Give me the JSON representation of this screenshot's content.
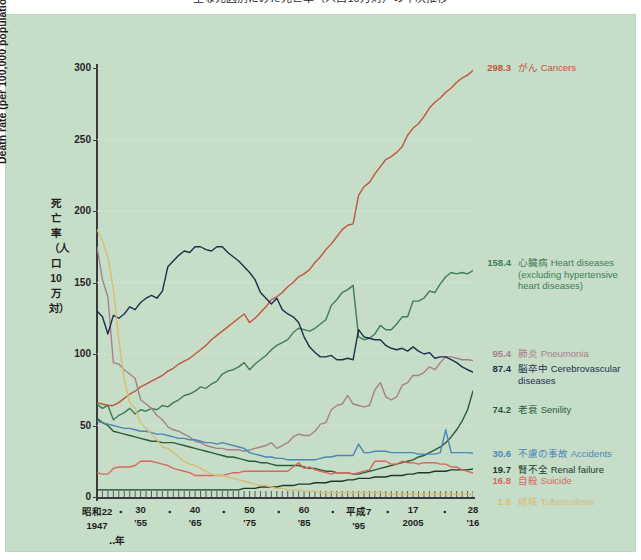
{
  "title": "主な死因別にみた死亡率（人口10万対）の年次推移",
  "axes": {
    "y_label_en": "Death rate (per 100,000 population)",
    "y_label_jp": "死亡率（人口10万対）",
    "y_ticks": [
      "0",
      "50",
      "100",
      "150",
      "200",
      "250",
      "300"
    ],
    "x_year_note": "‥年",
    "x_ticks": [
      {
        "jp": "昭和22",
        "en": "1947"
      },
      {
        "jp": "30",
        "en": "'55"
      },
      {
        "jp": "40",
        "en": "'65"
      },
      {
        "jp": "50",
        "en": "'75"
      },
      {
        "jp": "60",
        "en": "'85"
      },
      {
        "jp": "平成7",
        "en": "'95"
      },
      {
        "jp": "17",
        "en": "2005"
      },
      {
        "jp": "28",
        "en": "'16"
      }
    ],
    "x_separator": "・"
  },
  "legend": [
    {
      "value": "298.3",
      "jp": "がん",
      "en": "Cancers",
      "sub": "",
      "color": "#c0563a"
    },
    {
      "value": "158.4",
      "jp": "心臓病",
      "en": "Heart diseases",
      "sub": "(excluding hypertensive\nheart diseases)",
      "color": "#3f7d55"
    },
    {
      "value": "95.4",
      "jp": "肺炎",
      "en": "Pneumonia",
      "sub": "",
      "color": "#a8808c"
    },
    {
      "value": "87.4",
      "jp": "脳卒中",
      "en": "Cerebrovascular\ndiseases",
      "sub": "",
      "color": "#1d2f4e"
    },
    {
      "value": "74.2",
      "jp": "老衰",
      "en": "Senility",
      "sub": "",
      "color": "#2b5c38"
    },
    {
      "value": "30.6",
      "jp": "不慮の事故",
      "en": "Accidents",
      "sub": "",
      "color": "#4a86b8"
    },
    {
      "value": "19.7",
      "jp": "腎不全",
      "en": "Renal failure",
      "sub": "",
      "color": "#1b3a2a"
    },
    {
      "value": "16.8",
      "jp": "自殺",
      "en": "Suicide",
      "sub": "",
      "color": "#d9675e"
    },
    {
      "value": "1.5",
      "jp": "結核",
      "en": "Tuberculosis",
      "sub": "",
      "color": "#d9bc72"
    }
  ],
  "chart_data": {
    "type": "line",
    "title": "主な死因別にみた死亡率（人口10万対）の年次推移",
    "xlabel": "Year",
    "ylabel": "Death rate (per 100,000 population)",
    "xlim": [
      1947,
      2016
    ],
    "ylim": [
      0,
      300
    ],
    "grid": true,
    "legend_position": "right-inline-endpoints",
    "x": [
      1947,
      1948,
      1949,
      1950,
      1951,
      1952,
      1953,
      1954,
      1955,
      1956,
      1957,
      1958,
      1959,
      1960,
      1961,
      1962,
      1963,
      1964,
      1965,
      1966,
      1967,
      1968,
      1969,
      1970,
      1971,
      1972,
      1973,
      1974,
      1975,
      1976,
      1977,
      1978,
      1979,
      1980,
      1981,
      1982,
      1983,
      1984,
      1985,
      1986,
      1987,
      1988,
      1989,
      1990,
      1991,
      1992,
      1993,
      1994,
      1995,
      1996,
      1997,
      1998,
      1999,
      2000,
      2001,
      2002,
      2003,
      2004,
      2005,
      2006,
      2007,
      2008,
      2009,
      2010,
      2011,
      2012,
      2013,
      2014,
      2015,
      2016
    ],
    "series": [
      {
        "name": "がん Cancers",
        "color": "#c0563a",
        "end_value": 298.3,
        "values": [
          66,
          65,
          64,
          64,
          66,
          69,
          72,
          74,
          77,
          79,
          81,
          83,
          85,
          88,
          90,
          93,
          95,
          97,
          100,
          103,
          106,
          110,
          113,
          116,
          119,
          122,
          125,
          128,
          122,
          125,
          129,
          133,
          138,
          140,
          143,
          147,
          150,
          154,
          156,
          159,
          164,
          168,
          173,
          177,
          182,
          187,
          190,
          191,
          211,
          217,
          220,
          226,
          231,
          236,
          238,
          241,
          245,
          253,
          258,
          261,
          266,
          272,
          276,
          279,
          283,
          286,
          290,
          293,
          295,
          298.3
        ]
      },
      {
        "name": "心臓病 Heart diseases",
        "color": "#3f7d55",
        "end_value": 158.4,
        "values": [
          65,
          62,
          64,
          54,
          57,
          59,
          62,
          58,
          61,
          60,
          62,
          61,
          64,
          63,
          66,
          68,
          71,
          72,
          74,
          77,
          76,
          79,
          81,
          86,
          88,
          89,
          91,
          94,
          89,
          93,
          96,
          99,
          103,
          106,
          108,
          110,
          115,
          118,
          117,
          116,
          118,
          121,
          124,
          134,
          138,
          143,
          145,
          148,
          112,
          110,
          111,
          114,
          120,
          117,
          117,
          121,
          126,
          126,
          137,
          137,
          139,
          144,
          143,
          149,
          154,
          157,
          156,
          157,
          156,
          158.4
        ]
      },
      {
        "name": "肺炎 Pneumonia",
        "color": "#a8808c",
        "end_value": 95.4,
        "values": [
          175,
          152,
          140,
          94,
          93,
          89,
          86,
          83,
          68,
          65,
          62,
          57,
          54,
          49,
          47,
          46,
          44,
          42,
          39,
          38,
          36,
          35,
          34,
          34,
          33,
          33,
          33,
          32,
          33,
          34,
          35,
          36,
          38,
          34,
          36,
          38,
          42,
          44,
          43,
          43,
          46,
          51,
          52,
          61,
          64,
          65,
          71,
          65,
          64,
          63,
          64,
          75,
          80,
          70,
          68,
          70,
          78,
          80,
          85,
          85,
          87,
          91,
          89,
          94,
          98,
          98,
          97,
          96,
          96,
          95.4
        ]
      },
      {
        "name": "脳卒中 Cerebrovascular diseases",
        "color": "#1d2f4e",
        "end_value": 87.4,
        "values": [
          130,
          126,
          114,
          127,
          125,
          128,
          133,
          131,
          136,
          139,
          141,
          139,
          144,
          161,
          165,
          169,
          172,
          171,
          175,
          175,
          173,
          172,
          175,
          175,
          171,
          168,
          165,
          161,
          157,
          152,
          143,
          139,
          135,
          139,
          131,
          128,
          126,
          122,
          112,
          105,
          101,
          98,
          98,
          99,
          96,
          96,
          97,
          96,
          117,
          112,
          111,
          110,
          110,
          106,
          104,
          103,
          104,
          102,
          105,
          102,
          100,
          101,
          97,
          98,
          98,
          96,
          94,
          91,
          89,
          87.4
        ]
      },
      {
        "name": "老衰 Senility",
        "color": "#2b5c38",
        "end_value": 74.2,
        "values": [
          55,
          52,
          50,
          46,
          45,
          44,
          43,
          42,
          41,
          40,
          39,
          39,
          38,
          38,
          38,
          37,
          36,
          35,
          34,
          33,
          32,
          31,
          30,
          29,
          28,
          28,
          27,
          26,
          25,
          25,
          24,
          24,
          23,
          22,
          22,
          22,
          22,
          22,
          21,
          20,
          20,
          19,
          18,
          18,
          17,
          17,
          17,
          16,
          16,
          17,
          18,
          19,
          20,
          21,
          22,
          23,
          24,
          25,
          26,
          28,
          29,
          31,
          33,
          35,
          38,
          42,
          47,
          53,
          61,
          74.2
        ]
      },
      {
        "name": "不慮の事故 Accidents",
        "color": "#4a86b8",
        "end_value": 30.6,
        "values": [
          53,
          52,
          51,
          50,
          49,
          48,
          48,
          47,
          46,
          46,
          45,
          44,
          44,
          43,
          42,
          41,
          41,
          40,
          40,
          39,
          38,
          38,
          37,
          38,
          37,
          36,
          35,
          34,
          31,
          30,
          29,
          28,
          28,
          27,
          27,
          26,
          26,
          26,
          26,
          26,
          26,
          27,
          28,
          28,
          29,
          29,
          29,
          29,
          37,
          31,
          31,
          32,
          32,
          32,
          31,
          31,
          31,
          31,
          31,
          30,
          30,
          30,
          30,
          31,
          47,
          31,
          31,
          31,
          31,
          30.6
        ]
      },
      {
        "name": "腎不全 Renal failure",
        "color": "#1b3a2a",
        "end_value": 19.7,
        "values": [
          5,
          5,
          5,
          5,
          5,
          5,
          5,
          5,
          5,
          5,
          5,
          5,
          5,
          5,
          5,
          5,
          5,
          5,
          5,
          5,
          5,
          5,
          5,
          5,
          5,
          5,
          5,
          6,
          6,
          6,
          7,
          7,
          7,
          7,
          8,
          8,
          8,
          9,
          9,
          9,
          10,
          10,
          10,
          11,
          11,
          11,
          12,
          12,
          13,
          13,
          13,
          14,
          14,
          14,
          15,
          15,
          15,
          16,
          16,
          17,
          17,
          17,
          18,
          18,
          18,
          19,
          19,
          19,
          19,
          19.7
        ]
      },
      {
        "name": "自殺 Suicide",
        "color": "#d9675e",
        "end_value": 16.8,
        "values": [
          17,
          16,
          16,
          20,
          21,
          21,
          21,
          22,
          25,
          25,
          25,
          24,
          23,
          22,
          20,
          19,
          18,
          17,
          15,
          15,
          15,
          15,
          15,
          15,
          16,
          17,
          17,
          18,
          18,
          18,
          18,
          18,
          18,
          18,
          18,
          18,
          21,
          24,
          20,
          21,
          19,
          18,
          17,
          16,
          17,
          17,
          17,
          16,
          17,
          18,
          19,
          25,
          25,
          25,
          23,
          23,
          25,
          24,
          24,
          23,
          24,
          24,
          24,
          23,
          23,
          21,
          21,
          19,
          18,
          16.8
        ]
      },
      {
        "name": "結核 Tuberculosis",
        "color": "#d9bc72",
        "end_value": 1.5,
        "values": [
          187,
          179,
          168,
          146,
          110,
          82,
          66,
          62,
          52,
          48,
          44,
          40,
          35,
          34,
          31,
          28,
          25,
          23,
          22,
          20,
          18,
          16,
          15,
          15,
          14,
          13,
          12,
          11,
          10,
          9,
          8,
          8,
          7,
          6,
          6,
          5,
          5,
          5,
          4,
          4,
          4,
          3,
          3,
          3,
          3,
          3,
          3,
          3,
          3,
          3,
          3,
          3,
          3,
          2,
          2,
          2,
          2,
          2,
          2,
          2,
          2,
          2,
          2,
          2,
          2,
          2,
          2,
          2,
          2,
          1.5
        ]
      }
    ]
  }
}
